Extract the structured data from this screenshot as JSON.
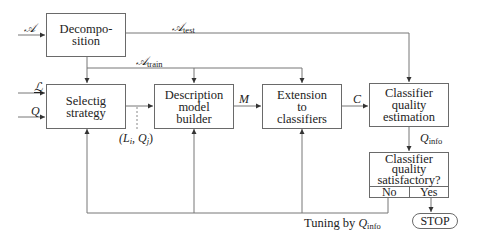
{
  "diagram": {
    "type": "flowchart",
    "nodes": {
      "decomposition": {
        "lines": [
          "Decompo-",
          "sition"
        ]
      },
      "selecting_strategy": {
        "lines": [
          "Selectig",
          "strategy"
        ]
      },
      "description_model_builder": {
        "lines": [
          "Description",
          "model",
          "builder"
        ]
      },
      "extension_to_classifiers": {
        "lines": [
          "Extension",
          "to",
          "classifiers"
        ]
      },
      "classifier_quality_estimation": {
        "lines": [
          "Classifier",
          "quality",
          "estimation"
        ]
      },
      "classifier_quality_satisfactory": {
        "lines": [
          "Classifier",
          "quality",
          "satisfactory?"
        ],
        "no_label": "No",
        "yes_label": "Yes"
      },
      "stop": {
        "label": "STOP"
      }
    },
    "edge_labels": {
      "input_a": "𝒜",
      "input_l": "ℒ",
      "input_q": "Q",
      "a_test_main": "𝒜",
      "a_test_sub": "test",
      "a_train_main": "𝒜",
      "a_train_sub": "train",
      "li_qj": "(L",
      "li_sub": "i",
      "li_mid": ", Q",
      "qj_sub": "j",
      "li_end": ")",
      "m": "M",
      "c": "C",
      "q_info_main": "Q",
      "q_info_sub": "info",
      "tuning_prefix": "Tuning by ",
      "tuning_q_main": "Q",
      "tuning_q_sub": "info"
    },
    "edges": [
      {
        "from": "input",
        "to": "decomposition",
        "label": "𝒜"
      },
      {
        "from": "decomposition",
        "to": "classifier_quality_estimation",
        "label": "𝒜test"
      },
      {
        "from": "decomposition",
        "to": "selecting_strategy",
        "label": "𝒜train"
      },
      {
        "from": "decomposition",
        "to": "extension_to_classifiers",
        "label": "𝒜train"
      },
      {
        "from": "input",
        "to": "selecting_strategy",
        "label": "ℒ"
      },
      {
        "from": "input",
        "to": "selecting_strategy",
        "label": "Q"
      },
      {
        "from": "selecting_strategy",
        "to": "description_model_builder",
        "label": "(Li, Qj)"
      },
      {
        "from": "description_model_builder",
        "to": "extension_to_classifiers",
        "label": "M"
      },
      {
        "from": "extension_to_classifiers",
        "to": "classifier_quality_estimation",
        "label": "C"
      },
      {
        "from": "classifier_quality_estimation",
        "to": "classifier_quality_satisfactory",
        "label": "Qinfo"
      },
      {
        "from": "classifier_quality_satisfactory",
        "to": "stop",
        "label": "Yes"
      },
      {
        "from": "classifier_quality_satisfactory",
        "to": [
          "selecting_strategy",
          "description_model_builder",
          "extension_to_classifiers"
        ],
        "label": "No — Tuning by Qinfo"
      }
    ]
  }
}
